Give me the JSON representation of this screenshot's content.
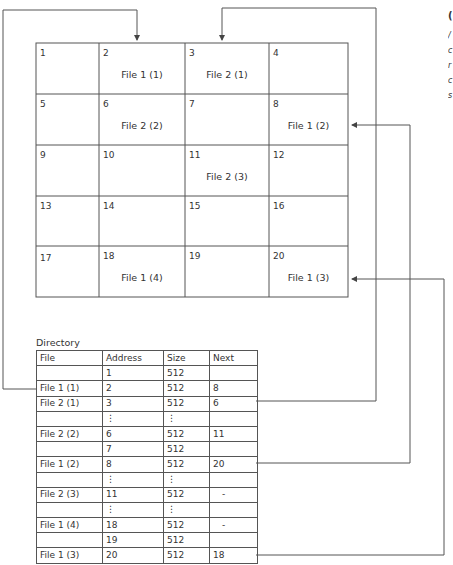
{
  "grid": {
    "cells": [
      {
        "n": "1",
        "file": ""
      },
      {
        "n": "2",
        "file": "File 1 (1)"
      },
      {
        "n": "3",
        "file": "File 2 (1)"
      },
      {
        "n": "4",
        "file": ""
      },
      {
        "n": "5",
        "file": ""
      },
      {
        "n": "6",
        "file": "File 2 (2)"
      },
      {
        "n": "7",
        "file": ""
      },
      {
        "n": "8",
        "file": "File 1 (2)"
      },
      {
        "n": "9",
        "file": ""
      },
      {
        "n": "10",
        "file": ""
      },
      {
        "n": "11",
        "file": "File 2 (3)"
      },
      {
        "n": "12",
        "file": ""
      },
      {
        "n": "13",
        "file": ""
      },
      {
        "n": "14",
        "file": ""
      },
      {
        "n": "15",
        "file": ""
      },
      {
        "n": "16",
        "file": ""
      },
      {
        "n": "17",
        "file": ""
      },
      {
        "n": "18",
        "file": "File 1 (4)"
      },
      {
        "n": "19",
        "file": ""
      },
      {
        "n": "20",
        "file": "File 1 (3)"
      }
    ]
  },
  "directory": {
    "label": "Directory",
    "headers": [
      "File",
      "Address",
      "Size",
      "Next"
    ],
    "rows": [
      [
        "",
        "1",
        "512",
        ""
      ],
      [
        "File 1 (1)",
        "2",
        "512",
        "8"
      ],
      [
        "File 2 (1)",
        "3",
        "512",
        "6"
      ],
      [
        "",
        "⋮",
        "⋮",
        ""
      ],
      [
        "File 2 (2)",
        "6",
        "512",
        "11"
      ],
      [
        "",
        "7",
        "512",
        ""
      ],
      [
        "File 1 (2)",
        "8",
        "512",
        "20"
      ],
      [
        "",
        "⋮",
        "⋮",
        ""
      ],
      [
        "File 2 (3)",
        "11",
        "512",
        "-"
      ],
      [
        "",
        "⋮",
        "⋮",
        ""
      ],
      [
        "File 1 (4)",
        "18",
        "512",
        "-"
      ],
      [
        "",
        "19",
        "512",
        ""
      ],
      [
        "File 1 (3)",
        "20",
        "512",
        "18"
      ]
    ]
  },
  "clipped_text": [
    "(",
    "/",
    "c",
    "r",
    "c",
    "s"
  ],
  "colors": {
    "line": "#555555",
    "text": "#333333"
  }
}
